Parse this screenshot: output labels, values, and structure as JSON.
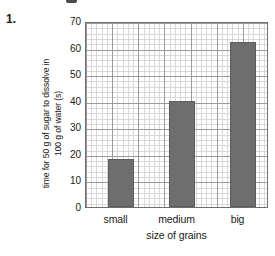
{
  "question_number": "1.",
  "chart_data": {
    "type": "bar",
    "title": "",
    "categories": [
      "small",
      "medium",
      "big"
    ],
    "values": [
      18,
      40,
      62
    ],
    "xlabel": "size of grains",
    "ylabel_lines": [
      "time for 50 g of sugar to dissolve in",
      "100 g of water (s)"
    ],
    "ylabel": "time for 50 g of sugar to dissolve in 100 g of water (s)",
    "ylim": [
      0,
      70
    ],
    "yticks": [
      0,
      10,
      20,
      30,
      40,
      50,
      60,
      70
    ],
    "ytick_labels": [
      "0",
      "10",
      "20",
      "30",
      "40",
      "50",
      "60",
      "70"
    ],
    "grid": true,
    "minor_grid": true,
    "legend": "none",
    "bar_color": "#6e6e6e",
    "grid_color": "#9a9a9a",
    "minor_grid_color": "#d8d8d8",
    "axis_color": "#6f6f6f"
  }
}
